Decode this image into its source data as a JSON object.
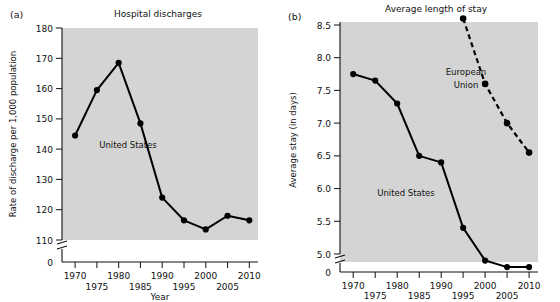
{
  "figure": {
    "panels": [
      {
        "letter": "(a)",
        "title": "Hospital discharges",
        "xlabel": "Year",
        "ylabel": "Rate of discharge per 1,000 population"
      },
      {
        "letter": "(b)",
        "title": "Average length of stay",
        "xlabel": "Year",
        "ylabel": "Average stay (in days)"
      }
    ]
  },
  "chart_data": [
    {
      "type": "line",
      "title": "Hospital discharges",
      "panel": "(a)",
      "xlabel": "Year",
      "ylabel": "Rate of discharge per 1,000 population",
      "x": [
        1970,
        1975,
        1980,
        1985,
        1990,
        1995,
        2000,
        2005,
        2010
      ],
      "xtick_labels": [
        "1970",
        "1975",
        "1980",
        "1985",
        "1990",
        "1995",
        "2000",
        "2005",
        "2010"
      ],
      "xlim": [
        1967,
        2012
      ],
      "ytick_labels": [
        "0",
        "110",
        "120",
        "130",
        "140",
        "150",
        "160",
        "170",
        "180"
      ],
      "ylim": [
        110,
        180
      ],
      "y_axis_break": true,
      "y_break_value": 0,
      "grid": false,
      "legend": "inline-annotation",
      "series": [
        {
          "name": "United States",
          "style": "solid",
          "marker": "filled-circle",
          "annotation": "United States",
          "values": [
            144.5,
            159.5,
            168.5,
            148.5,
            124.0,
            116.5,
            113.5,
            118.0,
            116.5
          ]
        }
      ]
    },
    {
      "type": "line",
      "title": "Average length of stay",
      "panel": "(b)",
      "xlabel": "Year",
      "ylabel": "Average stay (in days)",
      "x": [
        1970,
        1975,
        1980,
        1985,
        1990,
        1995,
        2000,
        2005,
        2010
      ],
      "xtick_labels": [
        "1970",
        "1975",
        "1980",
        "1985",
        "1990",
        "1995",
        "2000",
        "2005",
        "2010"
      ],
      "xlim": [
        1967,
        2012
      ],
      "ytick_labels": [
        "0",
        "5.0",
        "5.5",
        "6.0",
        "6.5",
        "7.0",
        "7.5",
        "8.0",
        "8.5"
      ],
      "ylim": [
        4.75,
        8.65
      ],
      "y_axis_break": true,
      "y_break_value": 0,
      "grid": false,
      "legend": "inline-annotation",
      "series": [
        {
          "name": "United States",
          "style": "solid",
          "marker": "filled-circle",
          "annotation": "United States",
          "x": [
            1970,
            1975,
            1980,
            1985,
            1990,
            1995,
            2000,
            2005,
            2010
          ],
          "values": [
            7.75,
            7.65,
            7.3,
            6.5,
            6.4,
            5.4,
            4.9,
            4.8,
            4.8
          ]
        },
        {
          "name": "European Union",
          "style": "dashed",
          "marker": "filled-circle",
          "annotation": "European Union",
          "x": [
            1995,
            2000,
            2005,
            2010
          ],
          "values": [
            8.6,
            7.6,
            7.0,
            6.55
          ]
        }
      ]
    }
  ],
  "annotations": {
    "united_states": "United States",
    "european_union_line1": "European",
    "european_union_line2": "Union"
  }
}
